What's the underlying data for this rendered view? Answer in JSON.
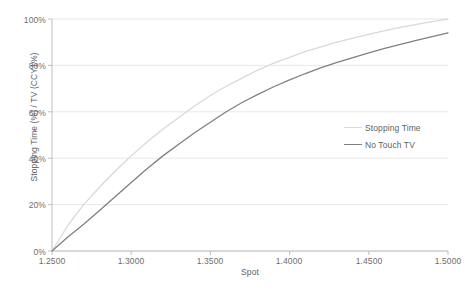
{
  "chart_data": {
    "type": "line",
    "title": "",
    "xlabel": "Spot",
    "ylabel": "Stopping Time (%) / TV (CCY1%)",
    "xlim": [
      1.25,
      1.5
    ],
    "ylim": [
      0,
      100
    ],
    "grid": true,
    "legend_position": "center-right",
    "x_tick_labels": [
      "1.2500",
      "1.3000",
      "1.3500",
      "1.4000",
      "1.4500",
      "1.5000"
    ],
    "x_ticks": [
      1.25,
      1.3,
      1.35,
      1.4,
      1.45,
      1.5
    ],
    "y_tick_labels": [
      "0%",
      "20%",
      "40%",
      "60%",
      "80%",
      "100%"
    ],
    "y_ticks": [
      0,
      20,
      40,
      60,
      80,
      100
    ],
    "x": [
      1.25,
      1.26,
      1.27,
      1.28,
      1.29,
      1.3,
      1.31,
      1.32,
      1.33,
      1.34,
      1.35,
      1.36,
      1.37,
      1.38,
      1.39,
      1.4,
      1.41,
      1.42,
      1.43,
      1.44,
      1.45,
      1.46,
      1.47,
      1.48,
      1.49,
      1.5
    ],
    "series": [
      {
        "name": "Stopping Time",
        "color": "#d9d9d9",
        "values": [
          0,
          11,
          20,
          27.5,
          34.5,
          41,
          47,
          52.5,
          57.5,
          62.5,
          67,
          71,
          74.5,
          78,
          81,
          83.5,
          86,
          88,
          90,
          91.8,
          93.4,
          95,
          96.4,
          97.7,
          98.9,
          100
        ]
      },
      {
        "name": "No Touch TV",
        "color": "#808080",
        "values": [
          0,
          6,
          11.5,
          17.5,
          23.5,
          29.5,
          35.5,
          41,
          46,
          51,
          55.5,
          60,
          64,
          67.5,
          70.8,
          73.8,
          76.5,
          79,
          81.3,
          83.4,
          85.4,
          87.3,
          89.1,
          90.8,
          92.4,
          94
        ]
      }
    ],
    "legend": [
      {
        "label": "Stopping Time",
        "color": "#d9d9d9"
      },
      {
        "label": "No Touch TV",
        "color": "#808080"
      }
    ],
    "axis_color": "#bfbfbf",
    "grid_color": "#e8e8e8",
    "background": "#ffffff"
  }
}
